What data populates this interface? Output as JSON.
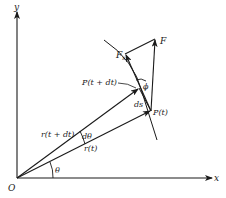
{
  "figure": {
    "colors": {
      "ink": "#1a1a1a",
      "background": "#ffffff"
    }
  },
  "axes": {
    "x_label": "x",
    "y_label": "y",
    "origin_label": "O"
  },
  "labels": {
    "theta": "θ",
    "d_theta": "dθ",
    "r_t": "r(t)",
    "r_t_dt": "r(t + dt)",
    "p_t": "P(t)",
    "p_t_dt": "P(t + dt)",
    "ds": "ds",
    "phi": "ϕ",
    "force": "F",
    "force_s_main": "F",
    "force_s_sub": "s"
  }
}
